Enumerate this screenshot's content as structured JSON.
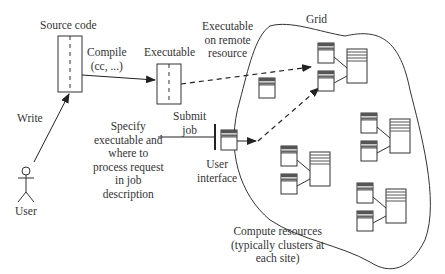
{
  "diagram": {
    "labels": {
      "source_code": "Source code",
      "compile_line1": "Compile",
      "compile_line2": "(cc, ...)",
      "executable": "Executable",
      "exec_remote_line1": "Executable",
      "exec_remote_line2": "on remote",
      "exec_remote_line3": "resource",
      "grid": "Grid",
      "write": "Write",
      "user": "User",
      "submit_line1": "Submit",
      "submit_line2": "job",
      "specify_line1": "Specify",
      "specify_line2": "executable and",
      "specify_line3": "where to",
      "specify_line4": "process request",
      "specify_line5": "in job",
      "specify_line6": "description",
      "ui_line1": "User",
      "ui_line2": "interface",
      "compute_line1": "Compute resources",
      "compute_line2": "(typically clusters at",
      "compute_line3": "each site)"
    },
    "colors": {
      "stroke": "#333333",
      "header_dark": "#555555",
      "header_light": "#bbbbbb",
      "background": "#ffffff"
    }
  }
}
